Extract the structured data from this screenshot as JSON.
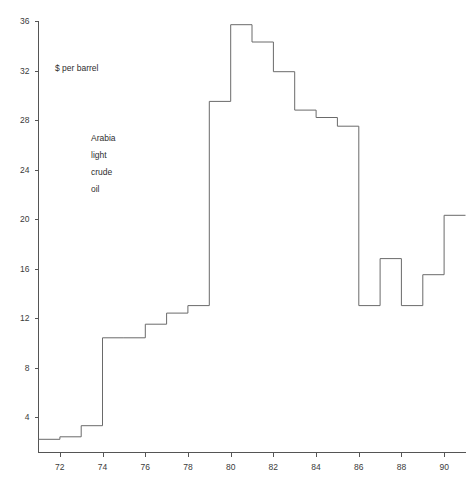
{
  "chart_data": {
    "type": "line",
    "subtype": "step",
    "title": "",
    "xlabel": "",
    "ylabel": "",
    "unit_label": "$ per barrel",
    "series_annotation": [
      "Arabia",
      "light",
      "crude",
      "oil"
    ],
    "x": [
      1971,
      1972,
      1973,
      1974,
      1975,
      1976,
      1977,
      1978,
      1979,
      1980,
      1981,
      1982,
      1983,
      1984,
      1985,
      1986,
      1987,
      1988,
      1989,
      1990
    ],
    "values": [
      2.2,
      2.4,
      3.3,
      10.4,
      10.4,
      11.5,
      12.4,
      13.0,
      29.5,
      35.7,
      34.3,
      31.9,
      28.8,
      28.2,
      27.5,
      13.0,
      16.8,
      13.0,
      15.5,
      20.3
    ],
    "series": [
      {
        "name": "Arabia light crude oil",
        "values": [
          2.2,
          2.4,
          3.3,
          10.4,
          10.4,
          11.5,
          12.4,
          13.0,
          29.5,
          35.7,
          34.3,
          31.9,
          28.8,
          28.2,
          27.5,
          13.0,
          16.8,
          13.0,
          15.5,
          20.3
        ]
      }
    ],
    "xlim": [
      1971,
      1991
    ],
    "ylim": [
      0,
      36
    ],
    "ytick_values": [
      4,
      8,
      12,
      16,
      20,
      24,
      28,
      32,
      36
    ],
    "ytick_labels": [
      "4",
      "8",
      "12",
      "16",
      "20",
      "24",
      "28",
      "32",
      "36"
    ],
    "xtick_values": [
      1972,
      1974,
      1976,
      1978,
      1980,
      1982,
      1984,
      1986,
      1988,
      1990
    ],
    "xtick_labels": [
      "72",
      "74",
      "76",
      "78",
      "80",
      "82",
      "84",
      "86",
      "88",
      "90"
    ],
    "grid": false,
    "legend": "none",
    "line_color": "#6a6a6a",
    "axis_color": "#555555",
    "text_color": "#2e2e2e",
    "background": "#ffffff"
  },
  "annotations": {
    "unit": "$ per barrel",
    "label_line1": "Arabia",
    "label_line2": "light",
    "label_line3": "crude",
    "label_line4": "oil"
  }
}
